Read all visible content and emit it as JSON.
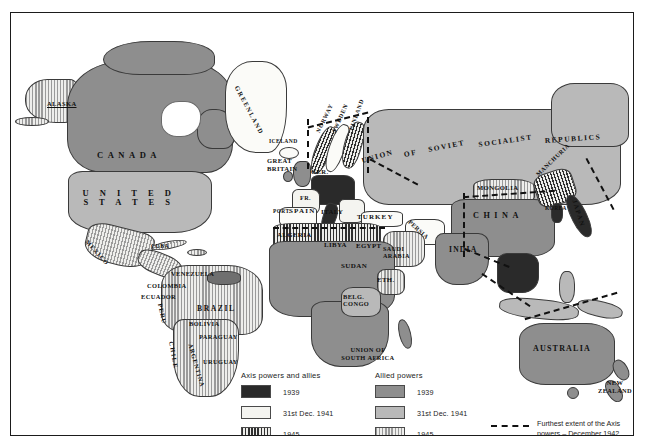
{
  "map": {
    "title": "World War II - Axis and Allied powers",
    "regions": [
      {
        "name": "ALASKA",
        "category": "allied1945",
        "x": 47,
        "y": 92,
        "w": 0,
        "h": 0
      },
      {
        "name": "CANADA",
        "category": "allied1939",
        "x": 118,
        "y": 143,
        "w": 0,
        "h": 0
      },
      {
        "name": "UNITED STATES",
        "category": "allied1941",
        "x": 118,
        "y": 182,
        "w": 0,
        "h": 0
      },
      {
        "name": "GREENLAND",
        "category": "neutral",
        "x": 240,
        "y": 92,
        "w": 0,
        "h": 0
      },
      {
        "name": "ICELAND",
        "category": "neutral",
        "x": 262,
        "y": 128,
        "w": 0,
        "h": 0
      },
      {
        "name": "MEXICO",
        "category": "allied1945",
        "x": 95,
        "y": 228,
        "w": 0,
        "h": 0
      },
      {
        "name": "CUBA",
        "category": "allied1945",
        "x": 148,
        "y": 236,
        "w": 0,
        "h": 0
      },
      {
        "name": "VENEZUELA",
        "category": "allied1945",
        "x": 182,
        "y": 262,
        "w": 0,
        "h": 0
      },
      {
        "name": "COLOMBIA",
        "category": "allied1945",
        "x": 155,
        "y": 275,
        "w": 0,
        "h": 0
      },
      {
        "name": "ECUADOR",
        "category": "allied1945",
        "x": 148,
        "y": 285,
        "w": 0,
        "h": 0
      },
      {
        "name": "PERU",
        "category": "allied1945",
        "x": 158,
        "y": 300,
        "w": 0,
        "h": 0
      },
      {
        "name": "BRAZIL",
        "category": "allied1945",
        "x": 200,
        "y": 296,
        "w": 0,
        "h": 0
      },
      {
        "name": "BOLIVIA",
        "category": "allied1945",
        "x": 186,
        "y": 312,
        "w": 0,
        "h": 0
      },
      {
        "name": "PARAGUAY",
        "category": "allied1945",
        "x": 200,
        "y": 325,
        "w": 0,
        "h": 0
      },
      {
        "name": "URUGUAY",
        "category": "allied1945",
        "x": 205,
        "y": 350,
        "w": 0,
        "h": 0
      },
      {
        "name": "CHILE",
        "category": "allied1945",
        "x": 163,
        "y": 345,
        "w": 0,
        "h": 0
      },
      {
        "name": "ARGENTINA",
        "category": "allied1945",
        "x": 186,
        "y": 355,
        "w": 0,
        "h": 0
      },
      {
        "name": "GREAT BRITAIN",
        "category": "allied1939",
        "x": 264,
        "y": 150,
        "w": 0,
        "h": 0
      },
      {
        "name": "NORWAY",
        "category": "axis1945",
        "x": 310,
        "y": 130,
        "w": 0,
        "h": 0
      },
      {
        "name": "SWEDEN",
        "category": "neutral",
        "x": 322,
        "y": 128,
        "w": 0,
        "h": 0
      },
      {
        "name": "FINLAND",
        "category": "axis1945",
        "x": 336,
        "y": 126,
        "w": 0,
        "h": 0
      },
      {
        "name": "GER.",
        "category": "axis1939",
        "x": 305,
        "y": 160,
        "w": 0,
        "h": 0
      },
      {
        "name": "FR.",
        "category": "axis1941",
        "x": 294,
        "y": 184,
        "w": 0,
        "h": 0
      },
      {
        "name": "PORT.",
        "category": "neutral",
        "x": 270,
        "y": 198,
        "w": 0,
        "h": 0
      },
      {
        "name": "SPAIN",
        "category": "neutral",
        "x": 286,
        "y": 199,
        "w": 0,
        "h": 0
      },
      {
        "name": "ITALY",
        "category": "axis1939",
        "x": 318,
        "y": 199,
        "w": 0,
        "h": 0
      },
      {
        "name": "TURKEY",
        "category": "neutral",
        "x": 356,
        "y": 205,
        "w": 0,
        "h": 0
      },
      {
        "name": "ALGERIA",
        "category": "axis1945",
        "x": 273,
        "y": 222,
        "w": 0,
        "h": 0
      },
      {
        "name": "LIBYA",
        "category": "axis1945",
        "x": 325,
        "y": 232,
        "w": 0,
        "h": 0
      },
      {
        "name": "EGYPT",
        "category": "allied1939",
        "x": 354,
        "y": 232,
        "w": 0,
        "h": 0
      },
      {
        "name": "SAUDI ARABIA",
        "category": "neutral",
        "x": 385,
        "y": 238,
        "w": 0,
        "h": 0
      },
      {
        "name": "PERSIA",
        "category": "neutral",
        "x": 403,
        "y": 214,
        "w": 0,
        "h": 0
      },
      {
        "name": "SUDAN",
        "category": "allied1939",
        "x": 343,
        "y": 254,
        "w": 0,
        "h": 0
      },
      {
        "name": "ETH.",
        "category": "allied1945",
        "x": 373,
        "y": 267,
        "w": 0,
        "h": 0
      },
      {
        "name": "BELG. CONGO",
        "category": "allied1941",
        "x": 344,
        "y": 285,
        "w": 0,
        "h": 0
      },
      {
        "name": "UNION OF SOUTH AFRICA",
        "category": "allied1939",
        "x": 357,
        "y": 338,
        "w": 0,
        "h": 0
      },
      {
        "name": "UNION OF SOVIET SOCIALIST REPUBLICS",
        "category": "allied1941",
        "x": 400,
        "y": 140,
        "w": 0,
        "h": 0
      },
      {
        "name": "MONGOLIA",
        "category": "allied1945",
        "x": 487,
        "y": 176,
        "w": 0,
        "h": 0
      },
      {
        "name": "MANCHURIA",
        "category": "axis1945",
        "x": 530,
        "y": 168,
        "w": 0,
        "h": 0
      },
      {
        "name": "KOREA",
        "category": "axis1939",
        "x": 543,
        "y": 196,
        "w": 0,
        "h": 0
      },
      {
        "name": "CHINA",
        "category": "allied1939",
        "x": 478,
        "y": 203,
        "w": 0,
        "h": 0
      },
      {
        "name": "JAPAN",
        "category": "axis1939",
        "x": 570,
        "y": 205,
        "w": 0,
        "h": 0
      },
      {
        "name": "INDIA",
        "category": "allied1939",
        "x": 453,
        "y": 237,
        "w": 0,
        "h": 0
      },
      {
        "name": "AUSTRALIA",
        "category": "allied1939",
        "x": 545,
        "y": 338,
        "w": 0,
        "h": 0
      },
      {
        "name": "NEW ZEALAND",
        "category": "allied1939",
        "x": 605,
        "y": 372,
        "w": 0,
        "h": 0
      }
    ]
  },
  "legend": {
    "axis": {
      "heading": "Axis powers and allies",
      "entries": [
        {
          "label": "1939",
          "swatch": "axis1939"
        },
        {
          "label": "31st Dec. 1941",
          "swatch": "axis1941"
        },
        {
          "label": "1945",
          "swatch": "axis1945"
        }
      ]
    },
    "allied": {
      "heading": "Allied powers",
      "entries": [
        {
          "label": "1939",
          "swatch": "allied1939"
        },
        {
          "label": "31st Dec. 1941",
          "swatch": "allied1941"
        },
        {
          "label": "1945",
          "swatch": "allied1945"
        }
      ]
    },
    "axis_extent": {
      "line1": "Furthest extent of the Axis",
      "line2": "powers  –  December 1942"
    }
  },
  "colors": {
    "axis_1939": "#2a2a2a",
    "axis_1941": "#f4f4f0",
    "allied_1939": "#8e8e8e",
    "allied_1941": "#b9b9b9",
    "neutral": "#fbfbf8",
    "frame": "#1b1b1b"
  }
}
